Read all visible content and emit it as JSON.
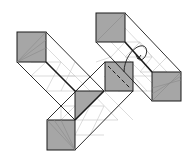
{
  "diagram": {
    "title": "",
    "colors": {
      "background": "#ffffff",
      "shaded_face": "#a6a6a6",
      "outline": "#1a1a1a",
      "crease": "#bdbdbd"
    },
    "elements": {
      "shaded_squares": 5,
      "shaded_triangles": 1,
      "arrow": "curved-rotate-arrow",
      "dashed_line": "fold-line"
    }
  }
}
